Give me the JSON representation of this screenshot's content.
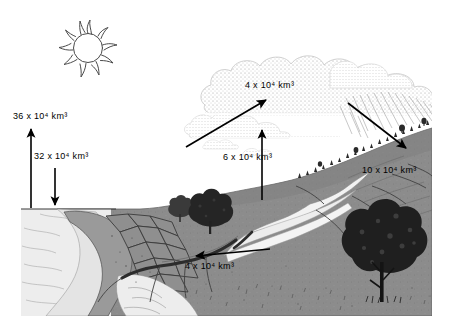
{
  "figure": {
    "colors": {
      "background": "#ffffff",
      "ocean": "#ededed",
      "land": "#8c8c8c",
      "land_dark": "#6e6e6e",
      "cloud": "#b8b8b8",
      "ink": "#000000",
      "rock": "#9a9a9a",
      "river": "#e8e8e8"
    }
  },
  "labels": {
    "evaporation_ocean": {
      "value": "36",
      "multiplier": "x 10",
      "exponent": "4",
      "unit": "km",
      "unit_exponent": "3",
      "text": "36 x 10⁴ km³"
    },
    "precipitation_ocean": {
      "value": "32",
      "multiplier": "x 10",
      "exponent": "4",
      "unit": "km",
      "unit_exponent": "3",
      "text": "32 x 10⁴ km³"
    },
    "vapor_transport": {
      "value": "4",
      "multiplier": "x 10",
      "exponent": "4",
      "unit": "km",
      "unit_exponent": "3",
      "text": "4 x 10⁴ km³"
    },
    "evapotranspiration_land": {
      "value": "6",
      "multiplier": "x 10",
      "exponent": "4",
      "unit": "km",
      "unit_exponent": "3",
      "text": "6 x 10⁴ km³"
    },
    "precipitation_land": {
      "value": "10",
      "multiplier": "x 10",
      "exponent": "4",
      "unit": "km",
      "unit_exponent": "3",
      "text": "10 x 10⁴ km³"
    },
    "runoff": {
      "value": "4",
      "multiplier": "x 10",
      "exponent": "4",
      "unit": "km",
      "unit_exponent": "3",
      "text": "4 x 10⁴ km³"
    }
  },
  "elements": {
    "sun": "sun-icon",
    "clouds": "cloud-mass",
    "rain": "rain-streaks",
    "ocean": "ocean-surface",
    "cliff": "coastal-cliff",
    "river": "river-channel",
    "trees_midground": "tree-small",
    "tree_foreground": "tree-large",
    "ridge_trees": "ridge-tree-line"
  },
  "arrows": {
    "evaporation_ocean": "arrow-up",
    "precipitation_ocean": "arrow-down",
    "vapor_transport": "arrow-diagonal-up-right",
    "evapotranspiration_land": "arrow-up",
    "precipitation_land": "arrow-diagonal-down-right",
    "runoff": "arrow-left"
  }
}
